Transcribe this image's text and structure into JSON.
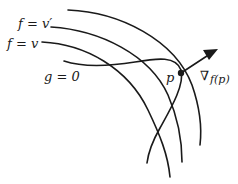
{
  "diagram": {
    "title": "",
    "labels": {
      "level_set_v_prime": "f = v′",
      "level_set_v": "f = v",
      "constraint": "g = 0",
      "point": "p",
      "gradient_symbol": "∇",
      "gradient_arg": "f(p)"
    },
    "colors": {
      "ink": "#1a1a1a",
      "background": "#ffffff"
    }
  }
}
